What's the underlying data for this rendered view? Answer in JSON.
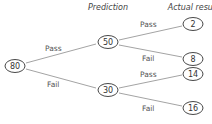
{
  "headers": {
    "prediction": "Prediction",
    "actual_result": "Actual result"
  },
  "nodes": {
    "root": "80",
    "pass": "50",
    "fail": "30",
    "pass_pass": "2",
    "pass_fail": "8",
    "fail_pass": "14",
    "fail_fail": "16"
  },
  "edges": {
    "root_pass": "Pass",
    "root_fail": "Fail",
    "pass_pass": "Pass",
    "pass_fail": "Fail",
    "fail_pass": "Pass",
    "fail_fail": "Fail"
  }
}
